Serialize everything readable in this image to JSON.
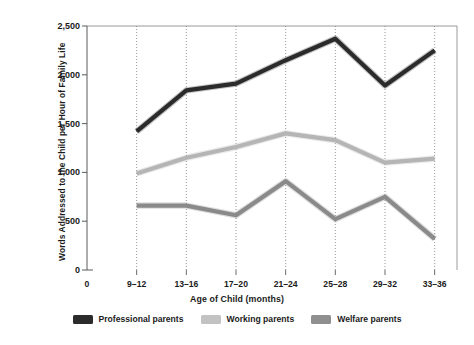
{
  "chart_data": {
    "type": "line",
    "title": "",
    "xlabel": "Age of Child (months)",
    "ylabel": "Words Addressed to the Child per Hour of Family Life",
    "categories": [
      "9–12",
      "13–16",
      "17–20",
      "21–24",
      "25–28",
      "29–32",
      "33–36"
    ],
    "xtick_labels": [
      "0",
      "9–12",
      "13–16",
      "17–20",
      "21–24",
      "25–28",
      "29–32",
      "33–36"
    ],
    "ytick_labels": [
      "0",
      "500",
      "1,000",
      "1,500",
      "2,000",
      "2,500"
    ],
    "ytick_values": [
      0,
      500,
      1000,
      1500,
      2000,
      2500
    ],
    "ylim": [
      0,
      2500
    ],
    "grid": "vertical-dotted",
    "legend_position": "bottom",
    "series": [
      {
        "name": "Professional parents",
        "color": "#2b2b2b",
        "values": [
          1420,
          1840,
          1910,
          2150,
          2370,
          1890,
          2250
        ]
      },
      {
        "name": "Working parents",
        "color": "#b5b5b5",
        "values": [
          990,
          1150,
          1260,
          1400,
          1330,
          1100,
          1140
        ]
      },
      {
        "name": "Welfare parents",
        "color": "#8a8a8a",
        "values": [
          660,
          660,
          560,
          910,
          520,
          750,
          320
        ]
      }
    ]
  },
  "legend": {
    "items": [
      {
        "label": "Professional parents",
        "color": "#2b2b2b"
      },
      {
        "label": "Working parents",
        "color": "#c2c2c2"
      },
      {
        "label": "Welfare parents",
        "color": "#8f8f8f"
      }
    ]
  },
  "axis": {
    "y_title": "Words Addressed to the Child per Hour of Family Life",
    "x_title": "Age of Child (months)"
  }
}
